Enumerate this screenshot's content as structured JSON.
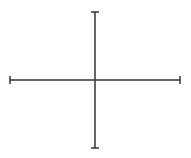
{
  "diagram": {
    "type": "crosshair-axes",
    "stroke_color": "#333333",
    "stroke_width": 1.5,
    "horizontal_axis": {
      "x1": 10,
      "x2": 180,
      "y": 80,
      "cap_length": 8
    },
    "vertical_axis": {
      "y1": 12,
      "y2": 148,
      "x": 95,
      "cap_length": 8
    },
    "labels": []
  }
}
